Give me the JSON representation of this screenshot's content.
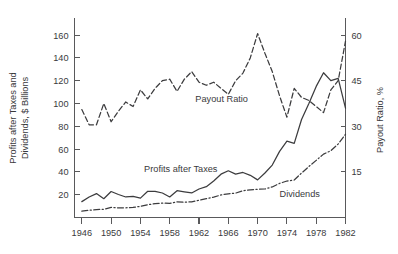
{
  "chart_data": {
    "type": "line",
    "title": "",
    "subtitle": "",
    "xlabel": "",
    "ylabel": "Profits after Taxes and\nDividends, $ Billions",
    "ylabel_line1": "Profits after Taxes and",
    "ylabel_line2": "Dividends, $ Billions",
    "y2label": "Payout Ratio, %",
    "xlim": [
      1945,
      1982
    ],
    "ylim": [
      0,
      175
    ],
    "y2lim": [
      0,
      65.625
    ],
    "grid": false,
    "legend_position": "inline-annotations",
    "xticks": [
      1946,
      1950,
      1954,
      1958,
      1962,
      1966,
      1970,
      1974,
      1978,
      1982
    ],
    "xtick_labels": [
      "1946",
      "1950",
      "1954",
      "1958",
      "1962",
      "1966",
      "1970",
      "1974",
      "1978",
      "1982"
    ],
    "xtick_minor": [
      1947,
      1948,
      1949,
      1951,
      1952,
      1953,
      1955,
      1956,
      1957,
      1959,
      1960,
      1961,
      1963,
      1964,
      1965,
      1967,
      1968,
      1969,
      1971,
      1972,
      1973,
      1975,
      1976,
      1977,
      1979,
      1980,
      1981
    ],
    "yticks": [
      20,
      40,
      60,
      80,
      100,
      120,
      140,
      160
    ],
    "ytick_labels": [
      "20",
      "40",
      "60",
      "80",
      "100",
      "120",
      "140",
      "160"
    ],
    "y2ticks": [
      15,
      30,
      45,
      60
    ],
    "y2tick_labels": [
      "15",
      "30",
      "45",
      "60"
    ],
    "x": [
      1946,
      1947,
      1948,
      1949,
      1950,
      1951,
      1952,
      1953,
      1954,
      1955,
      1956,
      1957,
      1958,
      1959,
      1960,
      1961,
      1962,
      1963,
      1964,
      1965,
      1966,
      1967,
      1968,
      1969,
      1970,
      1971,
      1972,
      1973,
      1974,
      1975,
      1976,
      1977,
      1978,
      1979,
      1980,
      1981,
      1982
    ],
    "series": [
      {
        "name": "Payout Ratio",
        "label": "Payout Ratio",
        "axis": "right",
        "style": "dashed",
        "units": "%",
        "values": [
          35.5,
          30.5,
          30.5,
          37.5,
          31.5,
          35.0,
          38.0,
          36.5,
          42.0,
          39.0,
          42.5,
          45.0,
          45.5,
          41.5,
          45.5,
          48.0,
          44.5,
          43.5,
          44.5,
          42.5,
          40.5,
          45.0,
          47.5,
          52.5,
          60.5,
          54.0,
          48.0,
          40.0,
          33.0,
          42.5,
          39.5,
          38.5,
          36.5,
          34.5,
          42.0,
          45.0,
          58.0
        ],
        "values_left_axis_equivalent": [
          94.7,
          81.3,
          81.3,
          100.0,
          84.0,
          93.3,
          101.3,
          97.3,
          112.0,
          104.0,
          113.3,
          120.0,
          121.3,
          110.7,
          121.3,
          128.0,
          118.7,
          116.0,
          118.7,
          113.3,
          108.0,
          120.0,
          126.7,
          140.0,
          161.3,
          144.0,
          128.0,
          106.7,
          88.0,
          113.3,
          105.3,
          102.7,
          97.3,
          92.0,
          112.0,
          120.0,
          154.7
        ]
      },
      {
        "name": "Profits after Taxes",
        "label": "Profits after Taxes",
        "axis": "left",
        "style": "solid",
        "units": "$ Billions",
        "values": [
          13.9,
          18.0,
          21.0,
          16.5,
          22.8,
          20.2,
          18.0,
          18.5,
          17.0,
          23.0,
          23.0,
          21.5,
          18.0,
          23.5,
          22.5,
          21.5,
          25.0,
          27.0,
          32.0,
          38.0,
          41.0,
          38.0,
          39.5,
          37.0,
          33.0,
          39.0,
          46.0,
          58.0,
          67.0,
          65.0,
          86.0,
          100.0,
          115.0,
          127.0,
          120.0,
          122.0,
          96.0
        ]
      },
      {
        "name": "Dividends",
        "label": "Dividends",
        "axis": "left",
        "style": "dashdot",
        "units": "$ Billions",
        "values": [
          5.6,
          6.3,
          7.0,
          7.2,
          8.8,
          8.5,
          8.5,
          8.8,
          9.8,
          11.2,
          12.1,
          12.6,
          12.4,
          13.7,
          13.4,
          13.8,
          15.2,
          16.5,
          17.8,
          19.8,
          20.8,
          21.4,
          23.5,
          24.3,
          24.7,
          25.0,
          26.8,
          29.9,
          32.0,
          32.9,
          39.0,
          44.7,
          50.1,
          55.6,
          58.6,
          64.5,
          73.0
        ]
      }
    ],
    "annotations": [
      {
        "text": "Payout Ratio",
        "x": 1961.5,
        "y_px": 102
      },
      {
        "text": "Profits after Taxes",
        "x": 1954.5,
        "y_px": 172
      },
      {
        "text": "Dividends",
        "x": 1973.0,
        "y_px": 197
      }
    ]
  },
  "colors": {
    "ink": "#3c3c3e",
    "axis": "#59595b",
    "text": "#3a3a3c",
    "background": "#ffffff"
  }
}
